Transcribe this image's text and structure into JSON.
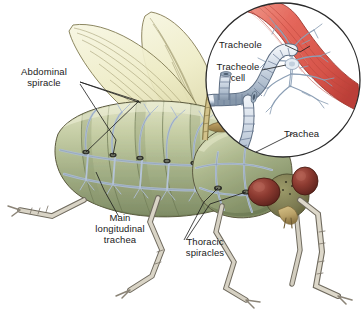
{
  "figure": {
    "width": 361,
    "height": 322,
    "background": "#ffffff"
  },
  "labels": {
    "abdominal_spiracle": "Abdominal\nspiracle",
    "abdominal_spiracle_line1": "Abdominal",
    "abdominal_spiracle_line2": "spiracle",
    "main_longitudinal_trachea_line1": "Main",
    "main_longitudinal_trachea_line2": "longitudinal",
    "main_longitudinal_trachea_line3": "trachea",
    "thoracic_spiracles_line1": "Thoracic",
    "thoracic_spiracles_line2": "spiracles",
    "tracheole": "Tracheole",
    "tracheole_cell_line1": "Tracheole",
    "tracheole_cell_line2": "cell",
    "trachea": "Trachea"
  },
  "colors": {
    "leader_line": "#1a1a1a",
    "text": "#1a1a1a",
    "background": "#ffffff",
    "abdomen_light": "#d8dcb8",
    "abdomen_mid": "#a9b48c",
    "abdomen_dark": "#7d8a66",
    "thorax_green": "#9aa882",
    "wing_fill": "#efeeca",
    "wing_edge": "#8c8459",
    "wing_vein": "#9b9468",
    "trachea_blue": "#c2cddb",
    "trachea_blue_dark": "#8a9bb0",
    "trachea_outline": "#5f6f83",
    "muscle_red": "#e8796b",
    "muscle_red_dark": "#c0463c",
    "eye_red": "#8e3b33",
    "eye_red_dark": "#5e231d",
    "head_olive": "#7d7b52",
    "leg_grey": "#cfc9bb",
    "leg_grey_dark": "#8b8477",
    "outline": "#4a443a",
    "circle_stroke": "#2b2b2b"
  },
  "inset": {
    "name": "magnified-trachea-circle",
    "center_x": 283,
    "center_y": 80,
    "radius": 78,
    "contents": [
      "trachea tube",
      "tracheole branches",
      "tracheole cell",
      "muscle fiber"
    ]
  },
  "anatomy": {
    "parts": [
      "abdomen",
      "thorax",
      "head",
      "compound eye",
      "forewing",
      "hindwing",
      "foreleg",
      "midleg",
      "hindleg",
      "spiracles",
      "longitudinal trachea",
      "tracheal network"
    ]
  }
}
